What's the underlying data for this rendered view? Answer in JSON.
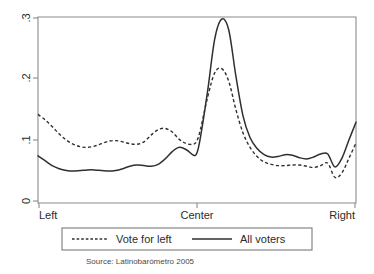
{
  "chart_data": {
    "type": "line",
    "title": "",
    "subtitle": "",
    "xlabel": "",
    "ylabel": "",
    "source_note": "Source: Latinobarómetro 2005",
    "grid": false,
    "legend_position": "bottom-center",
    "xlim": [
      1,
      10
    ],
    "ylim": [
      0,
      0.3
    ],
    "x_tick_positions": [
      1,
      5.5,
      10
    ],
    "x_tick_labels": [
      "Left",
      "Center",
      "Right"
    ],
    "y_tick_values": [
      0,
      0.1,
      0.2,
      0.3
    ],
    "y_tick_labels": [
      "0",
      ".1",
      ".2",
      ".3"
    ],
    "x": [
      1.0,
      1.2,
      1.4,
      1.6,
      1.8,
      2.0,
      2.2,
      2.4,
      2.6,
      2.8,
      3.0,
      3.2,
      3.4,
      3.6,
      3.8,
      4.0,
      4.2,
      4.4,
      4.6,
      4.8,
      5.0,
      5.2,
      5.4,
      5.5,
      5.6,
      5.8,
      6.0,
      6.2,
      6.4,
      6.6,
      6.8,
      7.0,
      7.2,
      7.4,
      7.6,
      7.8,
      8.0,
      8.2,
      8.4,
      8.6,
      8.8,
      9.0,
      9.2,
      9.4,
      9.6,
      9.8,
      10.0
    ],
    "series": [
      {
        "name": "Vote for left",
        "style": "dashed",
        "color": "#2f2f2f",
        "values": [
          0.142,
          0.133,
          0.122,
          0.11,
          0.1,
          0.093,
          0.089,
          0.088,
          0.09,
          0.094,
          0.098,
          0.099,
          0.097,
          0.094,
          0.093,
          0.097,
          0.108,
          0.117,
          0.119,
          0.113,
          0.101,
          0.094,
          0.093,
          0.099,
          0.118,
          0.17,
          0.21,
          0.217,
          0.196,
          0.15,
          0.112,
          0.088,
          0.073,
          0.064,
          0.06,
          0.058,
          0.058,
          0.059,
          0.059,
          0.057,
          0.055,
          0.058,
          0.062,
          0.059,
          0.048,
          0.041,
          0.04
        ]
      },
      {
        "name": "All voters",
        "style": "solid",
        "color": "#2f2f2f",
        "values": [
          0.074,
          0.066,
          0.058,
          0.053,
          0.05,
          0.049,
          0.05,
          0.051,
          0.051,
          0.05,
          0.049,
          0.05,
          0.053,
          0.057,
          0.059,
          0.058,
          0.057,
          0.06,
          0.069,
          0.081,
          0.088,
          0.084,
          0.075,
          0.079,
          0.105,
          0.18,
          0.265,
          0.298,
          0.28,
          0.205,
          0.14,
          0.104,
          0.086,
          0.076,
          0.072,
          0.073,
          0.076,
          0.075,
          0.071,
          0.069,
          0.072,
          0.077,
          0.077,
          0.069,
          0.058,
          0.053,
          0.053
        ]
      }
    ],
    "series_right_tail": {
      "note_internal": "tail rise toward Right edge",
      "x": [
        9.4,
        9.6,
        9.8,
        10.0
      ],
      "all_voters": [
        0.056,
        0.07,
        0.1,
        0.129
      ],
      "vote_for_left": [
        0.039,
        0.046,
        0.07,
        0.095
      ]
    },
    "endpoints": {
      "left_edge": {
        "vote_for_left": 0.142,
        "all_voters": 0.074
      },
      "center_peak": {
        "vote_for_left": 0.217,
        "all_voters": 0.3
      },
      "right_edge": {
        "vote_for_left": 0.095,
        "all_voters": 0.129
      }
    }
  },
  "legend": {
    "entries": [
      {
        "label": "Vote for left",
        "style": "dashed"
      },
      {
        "label": "All voters",
        "style": "solid"
      }
    ]
  },
  "axes": {
    "y_labels": [
      "0",
      ".1",
      ".2",
      ".3"
    ],
    "x_labels": [
      "Left",
      "Center",
      "Right"
    ]
  },
  "footer": {
    "source": "Source: Latinobarómetro 2005"
  }
}
